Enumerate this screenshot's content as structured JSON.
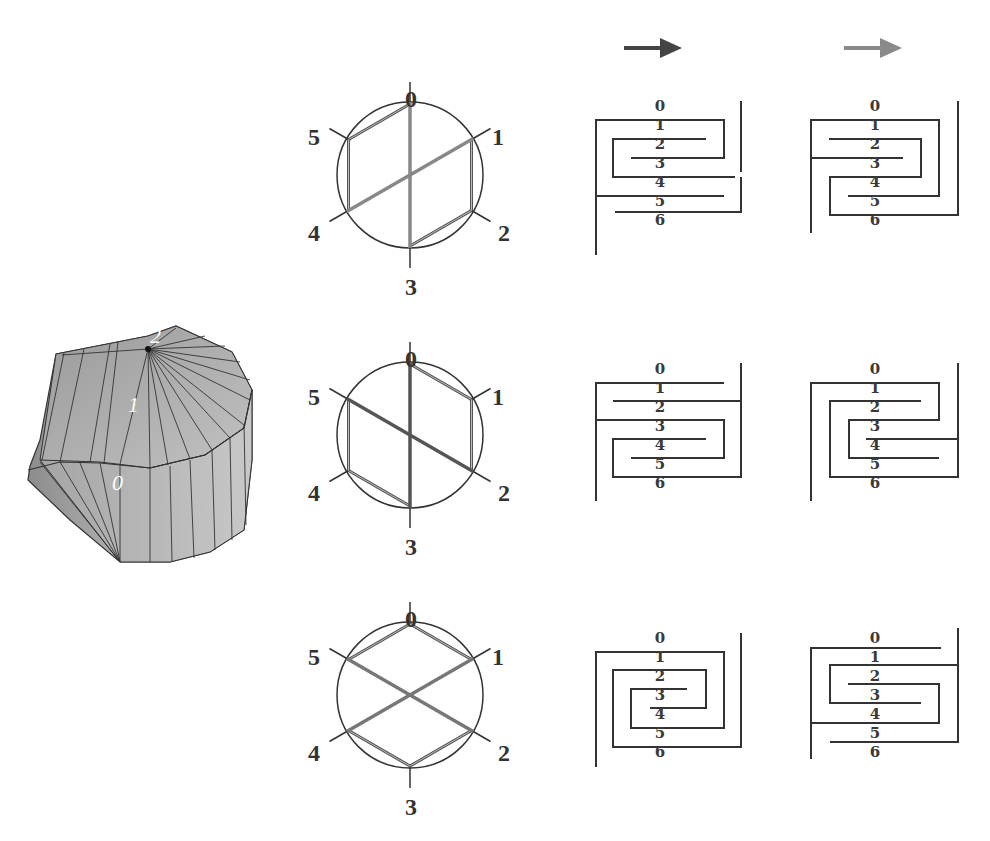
{
  "figure": {
    "colors": {
      "background": "#ffffff",
      "line": "#333333",
      "chord_dark": "#555555",
      "chord_light": "#888888",
      "arrow_dark": "#444444",
      "arrow_light": "#8a8a8a",
      "shape_fill": "#b5b5b5",
      "shape_edge": "#333333"
    },
    "solid": {
      "labels": [
        "0",
        "1",
        "2"
      ]
    },
    "arrows": [
      {
        "name": "arrow-dark",
        "color": "#444444"
      },
      {
        "name": "arrow-light",
        "color": "#8a8a8a"
      }
    ],
    "vertex_labels": [
      "0",
      "1",
      "2",
      "3",
      "4",
      "5"
    ],
    "meander_labels": [
      "0",
      "1",
      "2",
      "3",
      "4",
      "5",
      "6"
    ],
    "rows": [
      {
        "chords": [
          [
            0,
            3
          ],
          [
            1,
            4
          ]
        ],
        "edges": [
          [
            5,
            0
          ],
          [
            1,
            2
          ],
          [
            2,
            3
          ],
          [
            4,
            5
          ]
        ],
        "chord_color": "#888888"
      },
      {
        "chords": [
          [
            0,
            3
          ],
          [
            5,
            2
          ]
        ],
        "edges": [
          [
            0,
            1
          ],
          [
            1,
            2
          ],
          [
            3,
            4
          ],
          [
            4,
            5
          ]
        ],
        "chord_color": "#555555"
      },
      {
        "chords": [
          [
            5,
            2
          ],
          [
            1,
            4
          ]
        ],
        "edges": [
          [
            5,
            0
          ],
          [
            0,
            1
          ],
          [
            2,
            3
          ],
          [
            3,
            4
          ]
        ],
        "chord_color": "#777777"
      }
    ]
  }
}
